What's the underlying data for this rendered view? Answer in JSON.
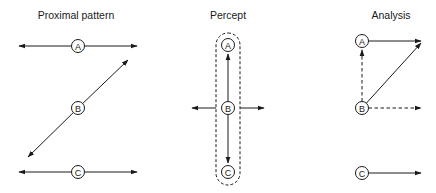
{
  "panels": [
    {
      "id": "proximal",
      "title": "Proximal pattern",
      "title_x": 76,
      "nodes": [
        {
          "label": "A",
          "x": 78,
          "y": 46
        },
        {
          "label": "B",
          "x": 78,
          "y": 108
        },
        {
          "label": "C",
          "x": 78,
          "y": 172
        }
      ],
      "edges": [
        {
          "from": [
            78,
            46
          ],
          "to": [
            19,
            46
          ],
          "style": "solid",
          "arrow": true
        },
        {
          "from": [
            78,
            46
          ],
          "to": [
            137,
            46
          ],
          "style": "solid",
          "arrow": true
        },
        {
          "from": [
            78,
            108
          ],
          "to": [
            128,
            60
          ],
          "style": "solid",
          "arrow": true
        },
        {
          "from": [
            78,
            108
          ],
          "to": [
            28,
            157
          ],
          "style": "solid",
          "arrow": true
        },
        {
          "from": [
            78,
            172
          ],
          "to": [
            19,
            172
          ],
          "style": "solid",
          "arrow": true
        },
        {
          "from": [
            78,
            172
          ],
          "to": [
            137,
            172
          ],
          "style": "solid",
          "arrow": true
        }
      ]
    },
    {
      "id": "percept",
      "title": "Percept",
      "title_x": 228,
      "nodes": [
        {
          "label": "A",
          "x": 228,
          "y": 45
        },
        {
          "label": "B",
          "x": 228,
          "y": 108
        },
        {
          "label": "C",
          "x": 228,
          "y": 172
        }
      ],
      "group_outline": {
        "x": 216,
        "y": 33,
        "width": 24,
        "height": 152,
        "style": "dashed"
      },
      "edges": [
        {
          "from": [
            228,
            108
          ],
          "to": [
            228,
            54
          ],
          "style": "solid",
          "arrow": true
        },
        {
          "from": [
            228,
            108
          ],
          "to": [
            228,
            163
          ],
          "style": "solid",
          "arrow": true
        },
        {
          "from": [
            216,
            108
          ],
          "to": [
            192,
            108
          ],
          "style": "solid",
          "arrow": true
        },
        {
          "from": [
            240,
            108
          ],
          "to": [
            264,
            108
          ],
          "style": "solid",
          "arrow": true
        }
      ]
    },
    {
      "id": "analysis",
      "title": "Analysis",
      "title_x": 391,
      "nodes": [
        {
          "label": "A",
          "x": 362,
          "y": 41
        },
        {
          "label": "B",
          "x": 362,
          "y": 108
        },
        {
          "label": "C",
          "x": 362,
          "y": 173
        }
      ],
      "edges": [
        {
          "from": [
            362,
            41
          ],
          "to": [
            421,
            41
          ],
          "style": "solid",
          "arrow": true
        },
        {
          "from": [
            362,
            108
          ],
          "to": [
            362,
            50
          ],
          "style": "dashed",
          "arrow": true
        },
        {
          "from": [
            362,
            108
          ],
          "to": [
            421,
            43
          ],
          "style": "solid",
          "arrow": true
        },
        {
          "from": [
            362,
            108
          ],
          "to": [
            421,
            108
          ],
          "style": "dashed",
          "arrow": true
        },
        {
          "from": [
            362,
            173
          ],
          "to": [
            421,
            173
          ],
          "style": "solid",
          "arrow": true
        }
      ]
    }
  ],
  "colors": {
    "stroke": "#1a1a1a",
    "background": "#ffffff"
  }
}
